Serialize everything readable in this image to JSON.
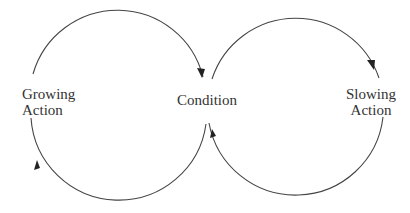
{
  "diagram": {
    "type": "causal-loop",
    "nodes": {
      "growing_action": {
        "line1": "Growing",
        "line2": "Action"
      },
      "condition": {
        "label": "Condition"
      },
      "slowing_action": {
        "line1": "Slowing",
        "line2": "Action"
      }
    },
    "loops": [
      {
        "name": "growth-loop",
        "from": "Growing Action",
        "to": "Condition",
        "direction": "clockwise"
      },
      {
        "name": "slowing-loop",
        "from": "Condition",
        "to": "Slowing Action",
        "direction": "clockwise"
      }
    ],
    "colors": {
      "line": "#444444",
      "text": "#333333",
      "background": "#ffffff"
    }
  }
}
